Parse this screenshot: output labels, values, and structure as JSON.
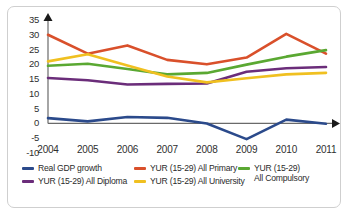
{
  "chart_data": {
    "type": "line",
    "title": "",
    "xlabel": "",
    "ylabel": "",
    "categories": [
      "2004",
      "2005",
      "2006",
      "2007",
      "2008",
      "2009",
      "2010",
      "2011"
    ],
    "x": [
      2004,
      2005,
      2006,
      2007,
      2008,
      2009,
      2010,
      2011
    ],
    "ylim": [
      -10,
      35
    ],
    "yticks": [
      "35",
      "30",
      "25",
      "20",
      "15",
      "10",
      "5",
      "0",
      "-5",
      "-10"
    ],
    "ytick_values": [
      35,
      30,
      25,
      20,
      15,
      10,
      5,
      0,
      -5,
      -10
    ],
    "grid": false,
    "legend_position": "bottom",
    "series": [
      {
        "name": "Real GDP growth",
        "color": "#2b4a8b",
        "values": [
          1.8,
          0.7,
          2.2,
          1.9,
          0.0,
          -5.3,
          1.3,
          -0.1
        ]
      },
      {
        "name": "YUR (15-29) All Primary",
        "color": "#d9502b",
        "values": [
          30.0,
          23.6,
          26.4,
          21.5,
          20.0,
          22.3,
          30.3,
          23.6
        ]
      },
      {
        "name": "YUR (15-29)\nAll Compulsory",
        "color": "#5aa832",
        "values": [
          19.5,
          20.2,
          18.4,
          16.6,
          17.1,
          19.9,
          22.6,
          24.8
        ]
      },
      {
        "name": "YUR (15-29) All Diploma",
        "color": "#6b2d7a",
        "values": [
          15.4,
          14.6,
          13.2,
          13.4,
          13.5,
          17.5,
          18.7,
          19.1
        ]
      },
      {
        "name": "YUR (15-29) All University",
        "color": "#f0c020",
        "values": [
          21.0,
          23.4,
          19.6,
          15.9,
          13.9,
          15.3,
          16.6,
          17.1
        ]
      }
    ]
  },
  "legend": {
    "items": [
      {
        "label": "Real GDP growth",
        "color": "#2b4a8b"
      },
      {
        "label": "YUR (15-29) All Primary",
        "color": "#d9502b"
      },
      {
        "label": "YUR (15-29)\nAll Compulsory",
        "color": "#5aa832"
      },
      {
        "label": "YUR (15-29) All Diploma",
        "color": "#6b2d7a"
      },
      {
        "label": "YUR (15-29) All University",
        "color": "#f0c020"
      }
    ]
  }
}
